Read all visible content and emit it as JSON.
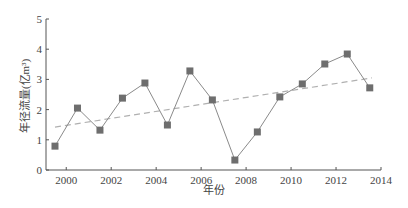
{
  "chart_data": {
    "type": "line",
    "title": "",
    "xlabel": "年份",
    "ylabel": "年径流量(亿m³)",
    "xlim": [
      1999.1,
      2014
    ],
    "ylim": [
      0,
      5
    ],
    "x_ticks": [
      2000,
      2002,
      2004,
      2006,
      2008,
      2010,
      2012,
      2014
    ],
    "y_ticks": [
      0,
      1,
      2,
      3,
      4,
      5
    ],
    "grid": false,
    "legend": null,
    "x": [
      1999.5,
      2000.5,
      2001.5,
      2002.5,
      2003.5,
      2004.5,
      2005.5,
      2006.5,
      2007.5,
      2008.5,
      2009.5,
      2010.5,
      2011.5,
      2012.5,
      2013.5
    ],
    "series": [
      {
        "name": "年径流量",
        "marker": "square",
        "color": "#6e6e6e",
        "values": [
          0.79,
          2.05,
          1.32,
          2.38,
          2.88,
          1.49,
          3.28,
          2.32,
          0.33,
          1.26,
          2.42,
          2.85,
          3.51,
          3.84,
          2.72
        ]
      },
      {
        "name": "线性趋势",
        "style": "dashed",
        "color": "#b0b0b0",
        "x": [
          1999.5,
          2013.6
        ],
        "values": [
          1.42,
          3.05
        ]
      }
    ]
  }
}
